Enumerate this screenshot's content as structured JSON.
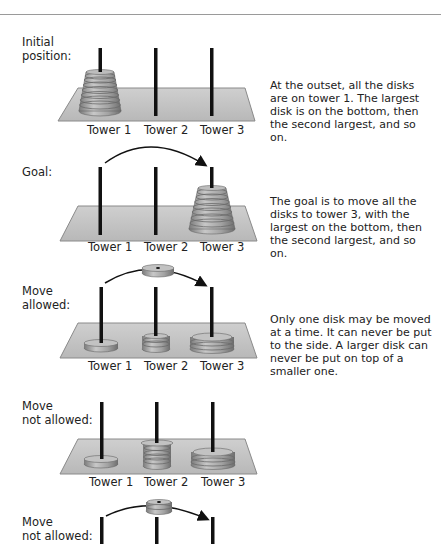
{
  "panels": [
    {
      "label_lines": [
        "Initial",
        "position:"
      ],
      "description": "At the outset, all the disks are on tower 1. The largest disk is on the bottom, then the second largest, and so on.",
      "towers": [
        "Tower 1",
        "Tower 2",
        "Tower 3"
      ]
    },
    {
      "label_lines": [
        "Goal:"
      ],
      "description": "The goal is to move all the disks to tower 3, with the largest on the bottom, then the second largest, and so on.",
      "towers": [
        "Tower 1",
        "Tower 2",
        "Tower 3"
      ]
    },
    {
      "label_lines": [
        "Move",
        "allowed:"
      ],
      "description": "Only one disk may be moved at a time. It can never be put to the side. A larger disk can never be put on top of a smaller one.",
      "towers": [
        "Tower 1",
        "Tower 2",
        "Tower 3"
      ]
    },
    {
      "label_lines": [
        "Move",
        "not allowed:"
      ],
      "description": "",
      "towers": [
        "Tower 1",
        "Tower 2",
        "Tower 3"
      ]
    },
    {
      "label_lines": [
        "Move",
        "not allowed:"
      ],
      "description": "",
      "towers": []
    }
  ],
  "colors": {
    "platform": "#c4c4c4",
    "platform_edge": "#8a8a8a",
    "disk": "#a8a8a8",
    "disk_dark": "#7d7d7d",
    "peg": "#111111"
  }
}
